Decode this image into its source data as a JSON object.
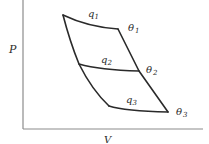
{
  "diagram": {
    "title": "",
    "axes": {
      "y_label": "P",
      "x_label": "V"
    },
    "isotherms": [
      {
        "id": "theta1",
        "label": "θ",
        "subscript": "1"
      },
      {
        "id": "theta2",
        "label": "θ",
        "subscript": "2"
      },
      {
        "id": "theta3",
        "label": "θ",
        "subscript": "3"
      }
    ],
    "heat_labels": [
      {
        "id": "q1",
        "label": "q",
        "subscript": "1"
      },
      {
        "id": "q2",
        "label": "q",
        "subscript": "2"
      },
      {
        "id": "q3",
        "label": "q",
        "subscript": "3"
      }
    ]
  }
}
